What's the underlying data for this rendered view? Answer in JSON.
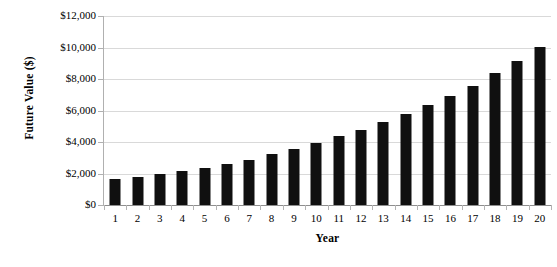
{
  "chart_data": {
    "type": "bar",
    "title": "",
    "xlabel": "Year",
    "ylabel": "Future Value ($)",
    "categories": [
      "1",
      "2",
      "3",
      "4",
      "5",
      "6",
      "7",
      "8",
      "9",
      "10",
      "11",
      "12",
      "13",
      "14",
      "15",
      "16",
      "17",
      "18",
      "19",
      "20"
    ],
    "values": [
      1650,
      1800,
      1960,
      2180,
      2380,
      2590,
      2870,
      3230,
      3550,
      3920,
      4380,
      4780,
      5250,
      5790,
      6350,
      6900,
      7560,
      8400,
      9150,
      10050
    ],
    "ylim": [
      0,
      12000
    ],
    "ytick_values": [
      0,
      2000,
      4000,
      6000,
      8000,
      10000,
      12000
    ],
    "ytick_labels": [
      "$0",
      "$2,000",
      "$4,000",
      "$6,000",
      "$8,000",
      "$10,000",
      "$12,000"
    ],
    "grid": true,
    "legend": "none",
    "bar_color": "#101010",
    "grid_color": "#d9d9d9",
    "axis_color": "#8e8e8e",
    "background": "#ffffff"
  }
}
